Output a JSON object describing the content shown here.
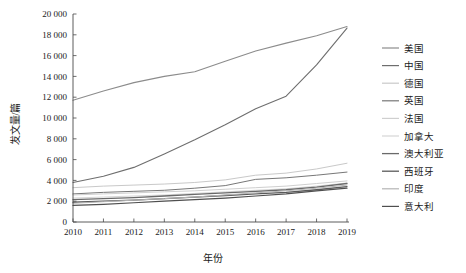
{
  "chart_data": {
    "type": "line",
    "title": "",
    "xlabel": "年份",
    "ylabel": "发文量/篇",
    "categories": [
      "2010",
      "2011",
      "2012",
      "2013",
      "2014",
      "2015",
      "2016",
      "2017",
      "2018",
      "2019"
    ],
    "x": [
      2010,
      2011,
      2012,
      2013,
      2014,
      2015,
      2016,
      2017,
      2018,
      2019
    ],
    "xlim": [
      2010,
      2019
    ],
    "ylim": [
      0,
      20000
    ],
    "ytick_step": 2000,
    "ytick_labels": [
      "0",
      "2 000",
      "4 000",
      "6 000",
      "8 000",
      "10 000",
      "12 000",
      "14 000",
      "16 000",
      "18 000",
      "20 000"
    ],
    "ytick_values": [
      0,
      2000,
      4000,
      6000,
      8000,
      10000,
      12000,
      14000,
      16000,
      18000,
      20000
    ],
    "grid": false,
    "legend_position": "right",
    "series": [
      {
        "name": "美国",
        "color": "#8c8c8c",
        "width": 1.1,
        "values": [
          11700,
          12600,
          13400,
          14000,
          14450,
          15450,
          16450,
          17200,
          17900,
          18800
        ]
      },
      {
        "name": "中国",
        "color": "#6e6e6e",
        "width": 1.1,
        "values": [
          3800,
          4400,
          5250,
          6550,
          7900,
          9350,
          10900,
          12100,
          15100,
          18650
        ]
      },
      {
        "name": "德国",
        "color": "#c9c9c9",
        "width": 1.0,
        "values": [
          3300,
          3450,
          3550,
          3650,
          3800,
          4050,
          4500,
          4700,
          5100,
          5650
        ]
      },
      {
        "name": "英国",
        "color": "#777777",
        "width": 1.0,
        "values": [
          2700,
          2850,
          2950,
          3050,
          3250,
          3500,
          4100,
          4250,
          4500,
          4800
        ]
      },
      {
        "name": "法国",
        "color": "#cfcfcf",
        "width": 1.0,
        "values": [
          2600,
          2700,
          2800,
          2900,
          3000,
          3150,
          3300,
          3450,
          3700,
          3950
        ]
      },
      {
        "name": "加拿大",
        "color": "#d6d6d6",
        "width": 1.0,
        "values": [
          2300,
          2400,
          2500,
          2600,
          2750,
          2900,
          3050,
          3200,
          3450,
          3750
        ]
      },
      {
        "name": "澳大利亚",
        "color": "#6a6a6a",
        "width": 1.3,
        "values": [
          2150,
          2250,
          2350,
          2500,
          2650,
          2800,
          2950,
          3100,
          3350,
          3700
        ]
      },
      {
        "name": "西班牙",
        "color": "#5a5a5a",
        "width": 1.3,
        "values": [
          1900,
          2000,
          2100,
          2250,
          2400,
          2550,
          2700,
          2850,
          3100,
          3400
        ]
      },
      {
        "name": "印度",
        "color": "#b5b5b5",
        "width": 1.0,
        "values": [
          1800,
          1950,
          2100,
          2250,
          2400,
          2600,
          2800,
          3000,
          3250,
          3550
        ]
      },
      {
        "name": "意大利",
        "color": "#4f4f4f",
        "width": 1.2,
        "values": [
          1600,
          1700,
          1850,
          2000,
          2150,
          2300,
          2500,
          2700,
          3000,
          3250
        ]
      }
    ]
  },
  "axes": {
    "y_title": "发文量/篇",
    "x_title": "年份"
  }
}
